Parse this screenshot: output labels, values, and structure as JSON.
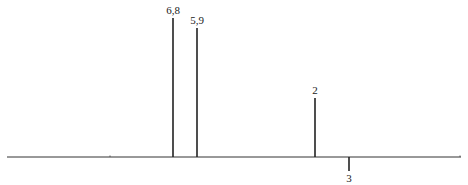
{
  "chart_data": {
    "type": "bar",
    "title": "",
    "xlabel": "",
    "ylabel": "",
    "grid": false,
    "legend": null,
    "baseline": {
      "x_start": 7,
      "x_end": 461,
      "y": 157
    },
    "minor_ticks_x": [
      110,
      460
    ],
    "peaks": [
      {
        "label": "6,8",
        "x": 173,
        "value": 139,
        "direction": "up"
      },
      {
        "label": "5,9",
        "x": 197,
        "value": 129,
        "direction": "up"
      },
      {
        "label": "2",
        "x": 315,
        "value": 59,
        "direction": "up"
      },
      {
        "label": "3",
        "x": 349,
        "value": -14,
        "direction": "down"
      }
    ],
    "categories": [
      "6,8",
      "5,9",
      "2",
      "3"
    ],
    "values": [
      139,
      129,
      59,
      -14
    ]
  },
  "colors": {
    "line": "#222222",
    "background": "#ffffff"
  }
}
